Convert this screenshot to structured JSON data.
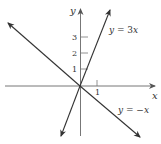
{
  "figure": {
    "axis_labels": {
      "x": "x",
      "y": "y"
    },
    "y_ticks": [
      {
        "value": 1,
        "label": "1"
      },
      {
        "value": 2,
        "label": "2"
      },
      {
        "value": 3,
        "label": "3"
      }
    ],
    "x_ticks": [
      {
        "value": 1,
        "label": "1"
      }
    ],
    "lines": [
      {
        "name": "line-y-equals-3x",
        "equation": "y = 3x",
        "label_y": "y",
        "label_eq": " = 3",
        "label_x": "x",
        "slope": 3
      },
      {
        "name": "line-y-equals-neg-x",
        "equation": "y = -x",
        "label_y": "y",
        "label_eq": " = −",
        "label_x": "x",
        "slope": -1
      }
    ],
    "colors": {
      "axis": "#777777",
      "line": "#333333",
      "text": "#333333",
      "background": "#ffffff"
    }
  }
}
